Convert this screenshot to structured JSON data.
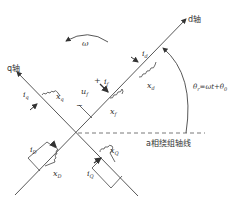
{
  "diagram": {
    "type": "synchronous-machine dq-axis winding diagram",
    "axes": {
      "d_axis_label": "d轴",
      "q_axis_label": "q轴",
      "reference_axis_label": "a相绕组轴线"
    },
    "rotation": {
      "omega_label": "ω",
      "angle_label": "θr=ωt+θ0",
      "angle_main": "θ",
      "angle_sub": "r",
      "angle_eq": "=ωt+θ",
      "angle_sub2": "0"
    },
    "windings": {
      "d": {
        "current": "i",
        "current_sub": "d",
        "reactance": "x",
        "reactance_sub": "d"
      },
      "q": {
        "current": "i",
        "current_sub": "q",
        "reactance": "x",
        "reactance_sub": "q"
      },
      "f": {
        "current": "i",
        "current_sub": "f",
        "reactance": "x",
        "reactance_sub": "f",
        "voltage": "u",
        "voltage_sub": "f",
        "plus": "+",
        "minus": "−"
      },
      "D": {
        "current": "i",
        "current_sub": "D",
        "reactance": "x",
        "reactance_sub": "D"
      },
      "Q": {
        "current": "i",
        "current_sub": "Q",
        "reactance": "x",
        "reactance_sub": "Q"
      }
    },
    "colors": {
      "line": "#444444",
      "background": "#ffffff"
    }
  }
}
